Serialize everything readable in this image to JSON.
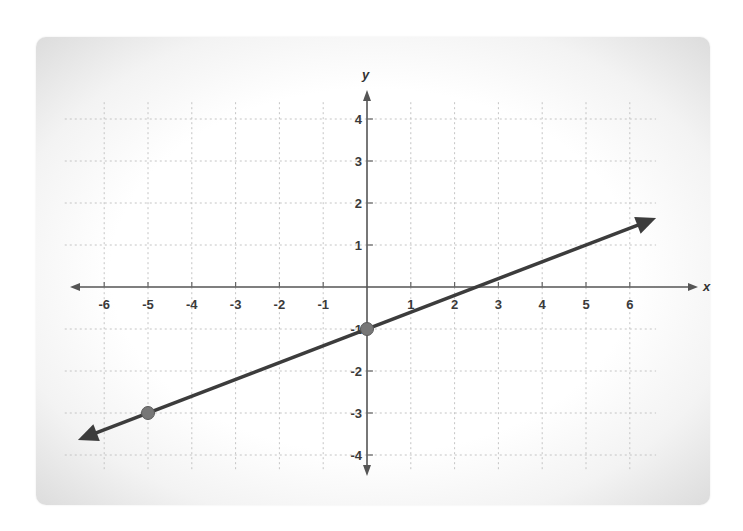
{
  "chart_data": {
    "type": "line",
    "title": "",
    "xlabel": "x",
    "ylabel": "y",
    "xlim": [
      -6,
      6
    ],
    "ylim": [
      -4,
      4
    ],
    "grid": true,
    "x_ticks": [
      "-6",
      "-5",
      "-4",
      "-3",
      "-2",
      "-1",
      "1",
      "2",
      "3",
      "4",
      "5",
      "6"
    ],
    "y_ticks": [
      "4",
      "3",
      "2",
      "1",
      "-1",
      "-2",
      "-3",
      "-4"
    ],
    "series": [
      {
        "name": "line",
        "equation": "y = 0.4x - 1",
        "slope": 0.4,
        "intercept": -1,
        "arrows": "both",
        "color": "#3c3c3c",
        "x": [
          -6.6,
          6.6
        ],
        "y": [
          -3.64,
          1.64
        ]
      }
    ],
    "points": [
      {
        "x": 0,
        "y": -1
      },
      {
        "x": -5,
        "y": -3
      }
    ],
    "point_color": "#777777"
  },
  "labels": {
    "x_axis": "x",
    "y_axis": "y"
  }
}
